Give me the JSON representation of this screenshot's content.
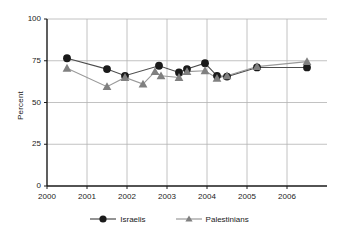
{
  "chart_data": {
    "type": "line",
    "title": "",
    "xlabel": "",
    "ylabel": "Percent",
    "xlim": [
      2000,
      2007
    ],
    "ylim": [
      0,
      100
    ],
    "xticks": [
      "2000",
      "2001",
      "2002",
      "2003",
      "2004",
      "2005",
      "2006"
    ],
    "xtick_values": [
      2000,
      2001,
      2002,
      2003,
      2004,
      2005,
      2006
    ],
    "yticks": [
      "0",
      "25",
      "50",
      "75",
      "100"
    ],
    "ytick_values": [
      0,
      25,
      50,
      75,
      100
    ],
    "grid": true,
    "grid_axis": "both",
    "legend_position": "bottom",
    "series": [
      {
        "name": "Israelis",
        "marker": "circle",
        "color": "#1a1a1a",
        "line_color": "#4d4d4d",
        "x": [
          2000.5,
          2001.5,
          2001.95,
          2002.8,
          2003.3,
          2003.5,
          2003.95,
          2004.25,
          2004.5,
          2005.25,
          2006.5
        ],
        "values": [
          76.5,
          70,
          66,
          72,
          68,
          70,
          73.5,
          66,
          65.5,
          71,
          71
        ]
      },
      {
        "name": "Palestinians",
        "marker": "triangle",
        "color": "#808080",
        "line_color": "#999999",
        "x": [
          2000.5,
          2001.5,
          2001.95,
          2002.4,
          2002.7,
          2002.85,
          2003.3,
          2003.5,
          2003.95,
          2004.25,
          2004.5,
          2005.25,
          2006.5
        ],
        "values": [
          70.5,
          59.5,
          65,
          61,
          68.5,
          66,
          65,
          68.5,
          69,
          64.5,
          66,
          71.5,
          74.5
        ]
      }
    ]
  },
  "legend": {
    "items": [
      {
        "label": "Israelis"
      },
      {
        "label": "Palestinians"
      }
    ]
  },
  "colors": {
    "israelis": "#1a1a1a",
    "palestinians": "#808080",
    "grid": "#b3b3b3",
    "axis": "#1a1a1a",
    "background": "#ffffff"
  }
}
